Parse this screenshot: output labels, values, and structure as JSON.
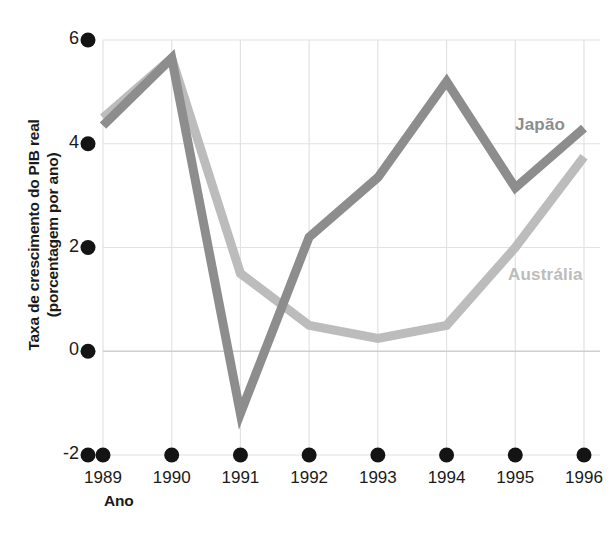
{
  "chart_data": {
    "type": "line",
    "title": "",
    "xlabel": "Ano",
    "ylabel_line1": "Taxa de crescimento do PIB real",
    "ylabel_line2": "(porcentagem por ano)",
    "categories": [
      "1989",
      "1990",
      "1991",
      "1992",
      "1993",
      "1994",
      "1995",
      "1996"
    ],
    "x": [
      1989,
      1990,
      1991,
      1992,
      1993,
      1994,
      1995,
      1996
    ],
    "ylim": [
      -2,
      6
    ],
    "xlim": [
      1989,
      1996
    ],
    "yticks": [
      6,
      4,
      2,
      0,
      -2
    ],
    "ytick_labels": [
      "6",
      "4",
      "2",
      "0",
      "-2"
    ],
    "grid": true,
    "grid_style": "light vertical gridlines at each year, horizontal gridlines at each y tick",
    "zero_line": true,
    "legend_position": "inline-labels-at-right-of-series",
    "series": [
      {
        "name": "Japão",
        "color": "#8d8d8d",
        "values": [
          4.35,
          5.65,
          -1.2,
          2.2,
          3.35,
          5.2,
          3.15,
          4.3
        ]
      },
      {
        "name": "Austrália",
        "color": "#bcbcbc",
        "values": [
          4.5,
          5.65,
          1.5,
          0.5,
          0.25,
          0.5,
          2.0,
          3.75
        ]
      }
    ],
    "annotations": [
      {
        "text": "Japão",
        "color": "#8d8d8d",
        "x": 1995.0,
        "y": 4.35
      },
      {
        "text": "Austrália",
        "color": "#bcbcbc",
        "x": 1994.9,
        "y": 1.45
      }
    ]
  },
  "colors": {
    "japan": "#8d8d8d",
    "australia": "#bcbcbc",
    "text": "#1a1a1a",
    "grid": "#e2e2e2",
    "tick_dot": "#141414",
    "background": "#ffffff"
  },
  "axes": {
    "x_title": "Ano",
    "y_title_line1": "Taxa de crescimento do PIB real",
    "y_title_line2": "(porcentagem por ano)"
  }
}
